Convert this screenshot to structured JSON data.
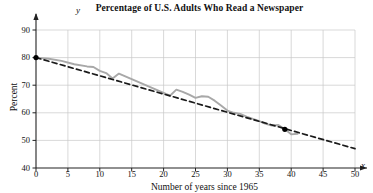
{
  "chart_data": {
    "type": "line",
    "title": "Percentage of U.S. Adults Who Read a Newspaper",
    "xlabel": "Number of years since 1965",
    "ylabel": "Percent",
    "xlim": [
      0,
      50
    ],
    "ylim": [
      40,
      90
    ],
    "xticks": [
      0,
      5,
      10,
      15,
      20,
      25,
      30,
      35,
      40,
      45,
      50
    ],
    "yticks": [
      40,
      50,
      60,
      70,
      80,
      90
    ],
    "grid": true,
    "legend": "none",
    "axis_letters": {
      "x": "x",
      "y": "y"
    },
    "series": [
      {
        "name": "Percentage of U.S. adults who read a newspaper",
        "style": "solid-gray-jagged",
        "color": "#a8a8a8",
        "x": [
          0,
          2,
          4,
          6,
          8,
          9,
          10,
          11,
          12,
          13,
          14,
          15,
          16,
          17,
          18,
          19,
          20,
          21,
          22,
          23,
          24,
          25,
          26,
          27,
          28,
          29,
          30,
          31,
          32,
          33,
          34,
          35,
          36,
          37,
          38,
          39,
          40,
          41
        ],
        "y": [
          80,
          79.6,
          78.8,
          77.6,
          76.8,
          76.6,
          75.2,
          74.4,
          72.4,
          74.2,
          73.2,
          72.2,
          71.2,
          70.2,
          69.2,
          68.2,
          67.2,
          66.2,
          68.4,
          67.6,
          66.6,
          65.4,
          66,
          65.8,
          64.4,
          62.6,
          60.8,
          60,
          59.6,
          58.6,
          57.8,
          57,
          56,
          55.4,
          55.6,
          54,
          52.2,
          52.4
        ]
      },
      {
        "name": "Linear trend line",
        "style": "dashed-black",
        "color": "#1a1a1a",
        "x": [
          0,
          50
        ],
        "y": [
          80,
          47
        ]
      }
    ],
    "markers": [
      {
        "x": 0,
        "y": 80,
        "color": "#000000"
      },
      {
        "x": 39,
        "y": 54,
        "color": "#000000"
      }
    ]
  }
}
